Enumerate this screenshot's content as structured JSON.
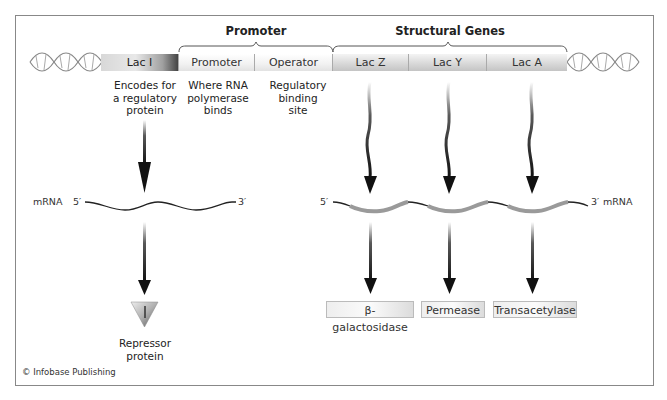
{
  "figure": {
    "credit": "© Infobase Publishing"
  },
  "brackets": {
    "promoter_title": "Promoter",
    "structural_title": "Structural Genes"
  },
  "genes": [
    {
      "label": "Lac I"
    },
    {
      "label": "Promoter"
    },
    {
      "label": "Operator"
    },
    {
      "label": "Lac Z"
    },
    {
      "label": "Lac Y"
    },
    {
      "label": "Lac A"
    }
  ],
  "descriptions": {
    "laci": [
      "Encodes for",
      "a regulatory",
      "protein"
    ],
    "promoter": [
      "Where RNA",
      "polymerase",
      "binds"
    ],
    "operator": [
      "Regulatory",
      "binding",
      "site"
    ]
  },
  "mrna_left": {
    "label": "mRNA",
    "five_prime": "5′",
    "three_prime": "3′"
  },
  "mrna_right": {
    "label": "mRNA",
    "five_prime": "5′",
    "three_prime": "3′"
  },
  "repressor": {
    "label_line1": "Repressor",
    "label_line2": "protein"
  },
  "proteins": [
    {
      "label": "β-galactosidase"
    },
    {
      "label": "Permease"
    },
    {
      "label": "Transacetylase"
    }
  ],
  "colors": {
    "arrow": "#111111",
    "mrna_coding": "#9a9a9a",
    "frame_border": "#888888"
  }
}
